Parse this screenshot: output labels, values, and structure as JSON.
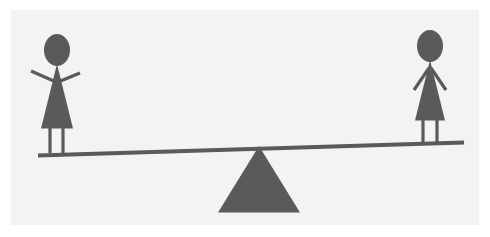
{
  "image": {
    "title": "Seesaw with two stick figures",
    "width": 490,
    "height": 237,
    "background_color": "#ffffff",
    "panel_color": "#f3f3f3",
    "figure_color": "#5a5a5a",
    "panel": {
      "x": 11,
      "y": 10,
      "width": 468,
      "height": 215
    }
  },
  "diagram": {
    "type": "seesaw-lever-illustration",
    "caption": "",
    "tilt_direction": "left-side-down",
    "elements": {
      "beam": {
        "name": "seesaw-plank",
        "left_end": {
          "x": 38,
          "y": 155
        },
        "right_end": {
          "x": 464,
          "y": 142
        },
        "thickness": 4,
        "color": "#5a5a5a"
      },
      "fulcrum": {
        "name": "triangle-fulcrum",
        "apex": {
          "x": 259,
          "y": 146
        },
        "base_left": {
          "x": 219,
          "y": 212
        },
        "base_right": {
          "x": 299,
          "y": 212
        },
        "color": "#5a5a5a"
      },
      "left_figure": {
        "name": "stick-figure-left",
        "pose": "arms-raised-up",
        "head_center": {
          "x": 57,
          "y": 50
        },
        "head_rx": 13,
        "head_ry": 16,
        "body_top": {
          "x": 57,
          "y": 64
        },
        "body_base_left": {
          "x": 41,
          "y": 128
        },
        "body_base_right": {
          "x": 73,
          "y": 128
        },
        "feet_y": 153,
        "color": "#5a5a5a"
      },
      "right_figure": {
        "name": "stick-figure-right",
        "pose": "arms-down-outward",
        "head_center": {
          "x": 430,
          "y": 46
        },
        "head_rx": 13,
        "head_ry": 16,
        "body_top": {
          "x": 430,
          "y": 60
        },
        "body_base_left": {
          "x": 415,
          "y": 120
        },
        "body_base_right": {
          "x": 445,
          "y": 120
        },
        "feet_y": 142,
        "color": "#5a5a5a"
      }
    }
  }
}
